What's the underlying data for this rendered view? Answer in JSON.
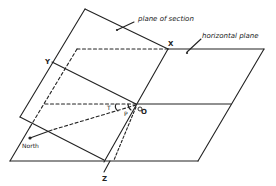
{
  "diagram": {
    "labels": {
      "plane_of_section": "plane of section",
      "horizontal_plane": "horizontal plane",
      "north": "North",
      "point_x": "X",
      "point_y": "Y",
      "point_z": "Z",
      "point_o": "O",
      "angle_t": "T",
      "angle_p": "P"
    },
    "colors": {
      "line": "#222222",
      "background": "#ffffff"
    }
  }
}
